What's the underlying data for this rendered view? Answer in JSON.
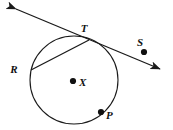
{
  "figure": {
    "type": "geometry-diagram",
    "background_color": "#ffffff",
    "stroke_color": "#1a1a1a",
    "label_color": "#111111",
    "width": 173,
    "height": 130
  },
  "circle": {
    "name": "circle-x",
    "center_label": "X",
    "center": {
      "x": 74,
      "y": 80
    },
    "radius": 44,
    "stroke_width": 1.1
  },
  "points": [
    {
      "id": "T",
      "label": "T",
      "x": 89,
      "y": 40,
      "label_x": 84,
      "label_y": 32,
      "dot": false,
      "role": "tangent-point"
    },
    {
      "id": "R",
      "label": "R",
      "x": 31,
      "y": 70,
      "label_x": 14,
      "label_y": 73,
      "dot": false,
      "role": "chord-endpoint"
    },
    {
      "id": "S",
      "label": "S",
      "x": 144,
      "y": 52,
      "label_x": 140,
      "label_y": 46,
      "dot": true,
      "role": "point-on-tangent"
    },
    {
      "id": "X",
      "label": "X",
      "x": 73,
      "y": 81,
      "label_x": 79,
      "label_y": 86,
      "dot": true,
      "role": "center"
    },
    {
      "id": "P",
      "label": "P",
      "x": 101,
      "y": 112,
      "label_x": 106,
      "label_y": 119,
      "dot": true,
      "role": "point-on-circle"
    }
  ],
  "lines": [
    {
      "id": "tangent-line",
      "label": "tangent through T and S",
      "x1": 16,
      "y1": 9,
      "x2": 160,
      "y2": 69,
      "arrow_start": true,
      "arrow_end": true,
      "stroke_width": 1.3
    },
    {
      "id": "chord-RT",
      "label": "chord from R to T",
      "x1": 31,
      "y1": 70,
      "x2": 89,
      "y2": 40,
      "arrow_start": false,
      "arrow_end": false,
      "stroke_width": 1.3
    }
  ],
  "dot_radius": 3.1
}
